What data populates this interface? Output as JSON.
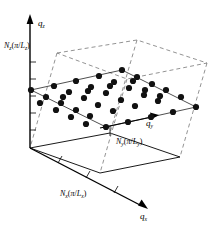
{
  "figure": {
    "caption_present": false,
    "background_color": "#ffffff",
    "ink_color": "#000000",
    "dashed_color": "#777777"
  },
  "axes": {
    "z": {
      "label": "q",
      "subscript": "z",
      "arrow": "up",
      "tick_count": 6
    },
    "y": {
      "label": "q",
      "subscript": "y",
      "arrow": "right"
    },
    "x": {
      "label": "q",
      "subscript": "x",
      "arrow": "down-right",
      "tick_count": 3
    }
  },
  "boundary_labels": [
    {
      "name": "z-boundary",
      "prefix": "N",
      "prefix_sub": "z",
      "open": "(",
      "pi": "π",
      "slash": "/",
      "denom": "L",
      "denom_sub": "z",
      "close": ")",
      "x": 4,
      "y": 48
    },
    {
      "name": "y-boundary",
      "prefix": "N",
      "prefix_sub": "y",
      "open": "(",
      "pi": "π",
      "slash": "/",
      "denom": "L",
      "denom_sub": "y",
      "close": ")",
      "x": 118,
      "y": 141
    },
    {
      "name": "x-boundary",
      "prefix": "N",
      "prefix_sub": "x",
      "open": "(",
      "pi": "π",
      "slash": "/",
      "denom": "L",
      "denom_sub": "x",
      "close": ")",
      "x": 62,
      "y": 196
    }
  ],
  "box": {
    "description": "dashed wireframe parallelepiped",
    "top_face": [
      [
        57,
        53
      ],
      [
        137,
        40
      ],
      [
        207,
        63
      ],
      [
        127,
        79
      ]
    ],
    "bottom_face": [
      [
        30,
        148
      ],
      [
        110,
        133
      ],
      [
        180,
        157
      ],
      [
        100,
        173
      ]
    ],
    "vertical_edges": [
      [
        [
          57,
          53
        ],
        [
          30,
          148
        ]
      ],
      [
        [
          137,
          40
        ],
        [
          110,
          133
        ]
      ],
      [
        [
          207,
          63
        ],
        [
          180,
          157
        ]
      ],
      [
        [
          127,
          79
        ],
        [
          100,
          173
        ]
      ]
    ]
  },
  "lattice_plane": {
    "shape": "rhombus",
    "vertices": [
      [
        31,
        90
      ],
      [
        122,
        70
      ],
      [
        196,
        107
      ],
      [
        106,
        127
      ]
    ],
    "point_color": "#111111",
    "point_radius": 3.1,
    "point_count": 40,
    "points": [
      [
        31,
        90
      ],
      [
        54,
        86
      ],
      [
        76,
        81
      ],
      [
        99,
        76
      ],
      [
        122,
        70
      ],
      [
        46,
        97
      ],
      [
        69,
        92
      ],
      [
        91,
        87
      ],
      [
        114,
        82
      ],
      [
        137,
        77
      ],
      [
        61,
        103
      ],
      [
        84,
        98
      ],
      [
        106,
        93
      ],
      [
        129,
        88
      ],
      [
        152,
        84
      ],
      [
        76,
        110
      ],
      [
        98,
        105
      ],
      [
        121,
        100
      ],
      [
        144,
        95
      ],
      [
        166,
        90
      ],
      [
        90,
        116
      ],
      [
        113,
        111
      ],
      [
        135,
        106
      ],
      [
        158,
        101
      ],
      [
        181,
        97
      ],
      [
        106,
        127
      ],
      [
        128,
        122
      ],
      [
        151,
        117
      ],
      [
        173,
        112
      ],
      [
        196,
        107
      ],
      [
        40,
        103
      ],
      [
        56,
        110
      ],
      [
        71,
        117
      ],
      [
        86,
        124
      ],
      [
        63,
        97
      ],
      [
        88,
        91
      ],
      [
        110,
        86
      ],
      [
        133,
        81
      ],
      [
        145,
        90
      ],
      [
        160,
        96
      ]
    ]
  },
  "ticks": {
    "z_axis": [
      [
        30,
        62
      ],
      [
        30,
        79
      ],
      [
        30,
        96
      ],
      [
        30,
        113
      ],
      [
        30,
        130
      ]
    ],
    "x_axis": [
      [
        58,
        163
      ],
      [
        86,
        178
      ],
      [
        114,
        193
      ]
    ]
  }
}
